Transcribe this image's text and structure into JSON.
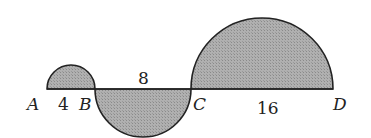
{
  "diagram": {
    "points": [
      {
        "name": "A",
        "x": 47
      },
      {
        "name": "B",
        "x": 95
      },
      {
        "name": "C",
        "x": 191
      },
      {
        "name": "D",
        "x": 333
      }
    ],
    "segments": [
      {
        "from": "A",
        "to": "B",
        "length_label": "4"
      },
      {
        "from": "B",
        "to": "C",
        "length_label": "8"
      },
      {
        "from": "C",
        "to": "D",
        "length_label": "16"
      }
    ],
    "semicircles": [
      {
        "diameter": "AB",
        "side": "above",
        "shaded": true
      },
      {
        "diameter": "BC",
        "side": "below",
        "shaded": true
      },
      {
        "diameter": "CD",
        "side": "above",
        "shaded": true
      }
    ],
    "fill_color": "#a8a8a8",
    "stroke_color": "#222222"
  },
  "labels": {
    "A": "A",
    "B": "B",
    "C": "C",
    "D": "D",
    "ab": "4",
    "bc": "8",
    "cd": "16"
  }
}
